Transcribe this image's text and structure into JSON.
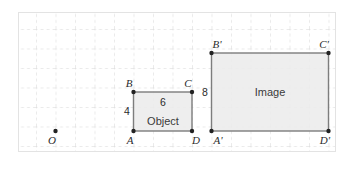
{
  "figure": {
    "background_color": "#ffffff",
    "card_border_color": "#e3e3e3",
    "grid": {
      "color": "#d6d6d6",
      "style": "dashed",
      "cell_px": 19.5,
      "columns": 16,
      "rows": 7
    },
    "shape_fill": "#ececec",
    "shape_stroke": "#7d7d7d",
    "point_color": "#222222"
  },
  "center_point": {
    "label": "O",
    "x": 2,
    "y": 1
  },
  "object": {
    "name_label": "Object",
    "fill": "#ececec",
    "stroke": "#7d7d7d",
    "vertices": [
      {
        "label": "A",
        "x": 6,
        "y": 1,
        "label_pos": "below-left"
      },
      {
        "label": "B",
        "x": 6,
        "y": 3,
        "label_pos": "above-left"
      },
      {
        "label": "C",
        "x": 9,
        "y": 3,
        "label_pos": "above-right"
      },
      {
        "label": "D",
        "x": 9,
        "y": 1,
        "label_pos": "below-right"
      }
    ],
    "dimensions": [
      {
        "value": "4",
        "side": "left",
        "meaning": "height"
      },
      {
        "value": "6",
        "side": "top",
        "meaning": "width"
      }
    ]
  },
  "image": {
    "name_label": "Image",
    "fill": "#ececec",
    "stroke": "#7d7d7d",
    "vertices": [
      {
        "label": "A'",
        "x": 10,
        "y": 1,
        "label_pos": "below-left"
      },
      {
        "label": "B'",
        "x": 10,
        "y": 5,
        "label_pos": "above-left"
      },
      {
        "label": "C'",
        "x": 16,
        "y": 5,
        "label_pos": "above-right"
      },
      {
        "label": "D'",
        "x": 16,
        "y": 1,
        "label_pos": "below-right"
      }
    ],
    "dimensions": [
      {
        "value": "8",
        "side": "left",
        "meaning": "height"
      }
    ]
  }
}
